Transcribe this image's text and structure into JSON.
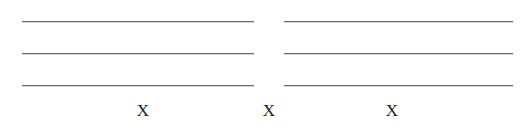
{
  "form": {
    "left_column": {
      "lines": 3
    },
    "right_column": {
      "lines": 3
    },
    "marks": [
      {
        "label": "X"
      },
      {
        "label": "X"
      },
      {
        "label": "X"
      }
    ]
  }
}
